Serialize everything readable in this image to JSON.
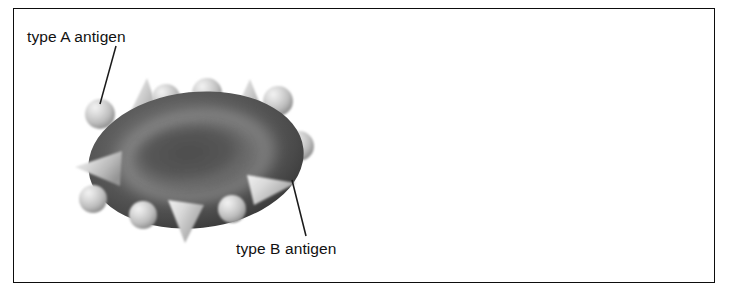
{
  "figure": {
    "background_color": "#ffffff",
    "frame_color": "#0d0d0d"
  },
  "labels": {
    "type_a": "type A antigen",
    "type_b": "type B antigen"
  },
  "diagram": {
    "cell": {
      "name": "red blood cell",
      "shape": "biconcave disc",
      "body_color": "#5e5e5e",
      "rim_color": "#343434",
      "dimple_color": "#5a5a5a",
      "ring_highlight_color": "#8e8e8e",
      "center_x": 196,
      "center_y": 160,
      "radius_x": 108,
      "radius_y": 68
    },
    "antigen_a": {
      "name": "type A antigen",
      "glyph": "sphere",
      "color": "#c9c9c9",
      "highlight_color": "#eeeeee",
      "shadow_color": "#8f8f8f",
      "count": 11
    },
    "antigen_b": {
      "name": "type B antigen",
      "glyph": "cone",
      "color": "#cccccc",
      "highlight_color": "#ededed",
      "shadow_color": "#939393",
      "count": 7
    },
    "leader_lines": [
      {
        "name": "leader-line-type-a",
        "from_x": 116,
        "from_y": 46,
        "to_x": 100,
        "to_y": 104
      },
      {
        "name": "leader-line-type-b",
        "from_x": 292,
        "from_y": 180,
        "to_x": 306,
        "to_y": 236
      }
    ]
  }
}
